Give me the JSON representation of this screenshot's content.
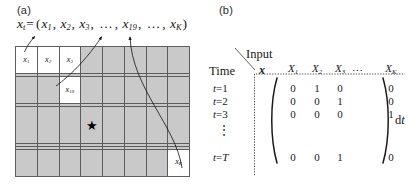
{
  "figure": {
    "panel_a": {
      "label": "(a)",
      "equation": {
        "lhs_var": "x",
        "lhs_sub": "t",
        "eq": "=",
        "open_paren": "(",
        "terms": [
          {
            "var": "x",
            "sub": "1"
          },
          {
            "var": "x",
            "sub": "2"
          },
          {
            "var": "x",
            "sub": "3"
          },
          {
            "var": "…",
            "sub": ""
          },
          {
            "var": "x",
            "sub": "19"
          },
          {
            "var": "…",
            "sub": ""
          },
          {
            "var": "x",
            "sub": "K"
          }
        ],
        "close_paren": ")",
        "separator": ",",
        "plain_text": "x_t = (x_1, x_2, x_3, ..., x_19, ..., x_K)"
      },
      "grid": {
        "columns": 8,
        "rows": 8,
        "cell_fill_color": "#c9c9c9",
        "cell_border_color": "#5d5d5d",
        "highlight_fill_color": "#ffffff",
        "labeled_cells": [
          {
            "row": 0,
            "col": 0,
            "var": "x",
            "sub": "1",
            "highlight": true
          },
          {
            "row": 0,
            "col": 1,
            "var": "x",
            "sub": "2",
            "highlight": true
          },
          {
            "row": 0,
            "col": 2,
            "var": "x",
            "sub": "3",
            "highlight": true
          },
          {
            "row": 2,
            "col": 2,
            "var": "x",
            "sub": "19",
            "highlight": true
          },
          {
            "row": 7,
            "col": 7,
            "var": "x",
            "sub": "K",
            "highlight": true
          }
        ],
        "star_cell": {
          "row": 4,
          "col": 3,
          "glyph": "★"
        }
      }
    },
    "panel_b": {
      "label": "(b)",
      "input_label": "Input",
      "time_label": "Time",
      "corner_symbol": "x",
      "column_headers": [
        {
          "var": "X",
          "sub": "1"
        },
        {
          "var": "X",
          "sub": "2"
        },
        {
          "var": "X",
          "sub": "3"
        },
        {
          "var": "⋯",
          "sub": ""
        },
        {
          "var": "X",
          "sub": "K"
        }
      ],
      "row_headers": [
        {
          "var": "t",
          "eq": "=",
          "val": "1"
        },
        {
          "var": "t",
          "eq": "=",
          "val": "2"
        },
        {
          "var": "t",
          "eq": "=",
          "val": "3"
        },
        {
          "var": "⋮",
          "eq": "",
          "val": ""
        },
        {
          "var": "t",
          "eq": "=",
          "val": "T"
        }
      ],
      "matrix": {
        "open_bracket": "(",
        "close_bracket": ")",
        "rows": [
          [
            "0",
            "1",
            "0",
            "0"
          ],
          [
            "0",
            "0",
            "1",
            "0"
          ],
          [
            "0",
            "0",
            "0",
            "1"
          ],
          [
            "",
            "",
            "",
            ""
          ],
          [
            "0",
            "0",
            "1",
            "0"
          ]
        ]
      },
      "dt_label": {
        "d": "d",
        "t": "t",
        "plain_text": "dt"
      }
    }
  }
}
